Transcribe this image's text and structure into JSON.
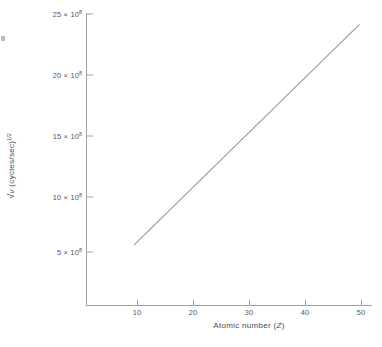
{
  "chart_data": {
    "type": "line",
    "title": "",
    "subtitle": "",
    "xlabel": "Atomic number (Z)",
    "ylabel": "√ν (cycles/sec)^1/2",
    "xlim": [
      5,
      52
    ],
    "ylim": [
      0,
      26
    ],
    "xticks": [
      10,
      20,
      30,
      40,
      50
    ],
    "yticks": [
      5,
      10,
      15,
      20,
      25
    ],
    "xtick_labels": [
      "10",
      "20",
      "30",
      "40",
      "50"
    ],
    "ytick_labels": [
      "5 × 10",
      "10 × 10",
      "15 × 10",
      "20 × 10",
      "25 × 10"
    ],
    "ytick_exponent": "8",
    "grid": false,
    "legend": "none",
    "line_color": "#9a9a9a",
    "axis_color": "#9e9e9e",
    "series": [
      {
        "name": "Moseley line",
        "x": [
          9.4,
          49.6
        ],
        "y": [
          5.6,
          24.1
        ],
        "y_scale": "1e8"
      }
    ]
  },
  "axis_titles": {
    "x": "Atomic number (",
    "x_symbol": "Z",
    "x_close": ")",
    "y_radical": "√",
    "y_symbol": "ν",
    "y_units": " (cycles/sec)",
    "y_exponent": "1/2"
  },
  "ytick_rows": [
    {
      "mantissa": "25 × 10",
      "exponent": "8"
    },
    {
      "mantissa": "20 × 10",
      "exponent": "8"
    },
    {
      "mantissa": "15 × 10",
      "exponent": "8"
    },
    {
      "mantissa": "10 × 10",
      "exponent": "8"
    },
    {
      "mantissa": "5 × 10",
      "exponent": "8"
    }
  ],
  "xtick_rows": [
    {
      "label": "10"
    },
    {
      "label": "20"
    },
    {
      "label": "30"
    },
    {
      "label": "40"
    },
    {
      "label": "50"
    }
  ]
}
